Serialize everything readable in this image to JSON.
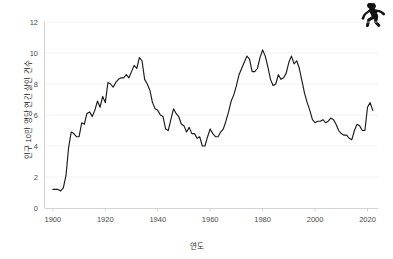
{
  "figure": {
    "icon": {
      "name": "crime-scene-body-outline-icon",
      "color": "#121212"
    }
  },
  "chart_data": {
    "type": "line",
    "title": "",
    "xlabel": "연도",
    "ylabel": "인구 10만 명당 연간 살인 건수",
    "xlim": [
      1897,
      2024
    ],
    "ylim": [
      0,
      12
    ],
    "grid": true,
    "legend": "none",
    "line_color": "#1a1a1a",
    "xticks": [
      1900,
      1920,
      1940,
      1960,
      1980,
      2000,
      2020
    ],
    "xticklabels": [
      "1900",
      "1920",
      "1940",
      "1960",
      "1980",
      "2000",
      "2020"
    ],
    "yticks": [
      0,
      2,
      4,
      6,
      8,
      10,
      12
    ],
    "yticklabels": [
      "0",
      "2",
      "4",
      "6",
      "8",
      "10",
      "12"
    ],
    "series": [
      {
        "name": "인구 10만 명당 연간 살인 건수",
        "x": [
          1900,
          1901,
          1902,
          1903,
          1904,
          1905,
          1906,
          1907,
          1908,
          1909,
          1910,
          1911,
          1912,
          1913,
          1914,
          1915,
          1916,
          1917,
          1918,
          1919,
          1920,
          1921,
          1922,
          1923,
          1924,
          1925,
          1926,
          1927,
          1928,
          1929,
          1930,
          1931,
          1932,
          1933,
          1934,
          1935,
          1936,
          1937,
          1938,
          1939,
          1940,
          1941,
          1942,
          1943,
          1944,
          1945,
          1946,
          1947,
          1948,
          1949,
          1950,
          1951,
          1952,
          1953,
          1954,
          1955,
          1956,
          1957,
          1958,
          1959,
          1960,
          1961,
          1962,
          1963,
          1964,
          1965,
          1966,
          1967,
          1968,
          1969,
          1970,
          1971,
          1972,
          1973,
          1974,
          1975,
          1976,
          1977,
          1978,
          1979,
          1980,
          1981,
          1982,
          1983,
          1984,
          1985,
          1986,
          1987,
          1988,
          1989,
          1990,
          1991,
          1992,
          1993,
          1994,
          1995,
          1996,
          1997,
          1998,
          1999,
          2000,
          2001,
          2002,
          2003,
          2004,
          2005,
          2006,
          2007,
          2008,
          2009,
          2010,
          2011,
          2012,
          2013,
          2014,
          2015,
          2016,
          2017,
          2018,
          2019,
          2020,
          2021,
          2022
        ],
        "values": [
          1.2,
          1.2,
          1.2,
          1.1,
          1.3,
          2.1,
          3.9,
          4.9,
          4.8,
          4.6,
          4.6,
          5.5,
          5.4,
          6.1,
          6.2,
          5.9,
          6.3,
          6.9,
          6.5,
          7.2,
          6.8,
          8.1,
          8.0,
          7.8,
          8.1,
          8.3,
          8.4,
          8.4,
          8.6,
          8.4,
          8.8,
          9.2,
          9.0,
          9.7,
          9.5,
          8.3,
          8.0,
          7.6,
          6.8,
          6.4,
          6.3,
          6.0,
          5.9,
          5.1,
          5.0,
          5.7,
          6.4,
          6.1,
          5.9,
          5.4,
          5.3,
          4.9,
          5.2,
          4.8,
          4.8,
          4.5,
          4.6,
          4.0,
          4.0,
          4.6,
          5.1,
          4.8,
          4.6,
          4.6,
          4.9,
          5.1,
          5.6,
          6.2,
          6.9,
          7.3,
          7.9,
          8.6,
          9.0,
          9.4,
          9.8,
          9.6,
          8.8,
          8.8,
          9.0,
          9.7,
          10.2,
          9.8,
          9.1,
          8.3,
          7.9,
          8.0,
          8.6,
          8.3,
          8.4,
          8.7,
          9.4,
          9.8,
          9.3,
          9.5,
          9.0,
          8.2,
          7.4,
          6.8,
          6.3,
          5.7,
          5.5,
          5.6,
          5.6,
          5.7,
          5.5,
          5.6,
          5.8,
          5.7,
          5.4,
          5.0,
          4.8,
          4.7,
          4.7,
          4.5,
          4.4,
          5.0,
          5.4,
          5.3,
          5.0,
          5.0,
          6.5,
          6.8,
          6.3
        ]
      }
    ]
  }
}
